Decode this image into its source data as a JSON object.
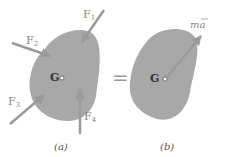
{
  "figure": {
    "panel_a": {
      "caption": "(a)",
      "center_label": "G",
      "forces": [
        {
          "label": "F",
          "sub": "1"
        },
        {
          "label": "F",
          "sub": "2"
        },
        {
          "label": "F",
          "sub": "3"
        },
        {
          "label": "F",
          "sub": "4"
        }
      ]
    },
    "equals": "=",
    "panel_b": {
      "caption": "(b)",
      "center_label": "G",
      "vector_label": "ma",
      "vector_bar": "—"
    },
    "colors": {
      "body_fill": "#a8a8a8",
      "arrow": "#9a9a9a",
      "text": "#888888"
    }
  }
}
